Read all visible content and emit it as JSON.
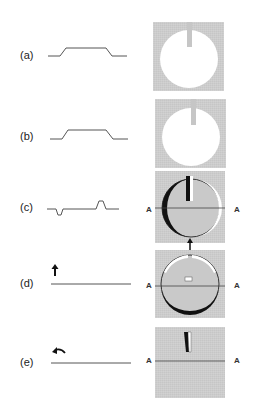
{
  "figure": {
    "panels": [
      {
        "id": "a",
        "label": "(a)",
        "profile": "plateau",
        "image": "disc-with-notch"
      },
      {
        "id": "b",
        "label": "(b)",
        "profile": "plateau",
        "image": "disc-with-notch"
      },
      {
        "id": "c",
        "label": "(c)",
        "profile": "dip-and-bump",
        "image": "disc-shaded-left-dark-right-light",
        "axis_labels": [
          "A",
          "A"
        ]
      },
      {
        "id": "d",
        "label": "(d)",
        "profile": "flat",
        "indicator": "up-arrow",
        "image": "disc-shaded-bottom-dark-top-light",
        "axis_labels": [
          "A",
          "A"
        ]
      },
      {
        "id": "e",
        "label": "(e)",
        "profile": "flat",
        "indicator": "curved-arrow",
        "image": "slit",
        "axis_labels": [
          "A",
          "A"
        ]
      }
    ],
    "connector_arrow": "up-arrow-between-c-and-d",
    "colors": {
      "background": "#ffffff",
      "box_fill": "#c6c6c6",
      "disc_fill": "#ffffff",
      "line": "#555555",
      "dark_shade": "#111111"
    }
  }
}
